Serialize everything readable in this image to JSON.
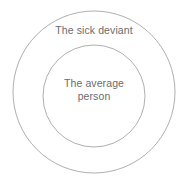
{
  "diagram": {
    "type": "concentric-circles",
    "background_color": "#ffffff",
    "stroke_color": "#9a9a9a",
    "stroke_width": 0.8,
    "text_color": "#6b6b6b",
    "outer_circle": {
      "label": "The sick deviant",
      "center_x": 94,
      "center_y": 92,
      "radius": 81
    },
    "inner_circle": {
      "label": "The average\nperson",
      "label_line_1": "The average",
      "label_line_2": "person",
      "center_x": 94,
      "center_y": 96,
      "radius": 51
    }
  }
}
